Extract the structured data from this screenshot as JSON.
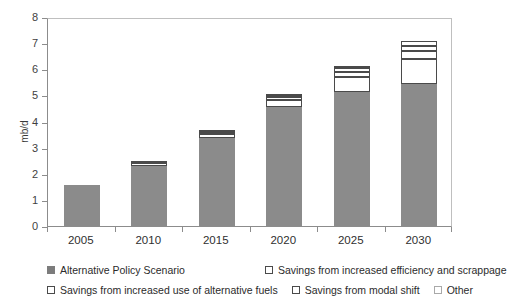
{
  "chart_data": {
    "type": "bar",
    "title": "",
    "xlabel": "",
    "ylabel": "mb/d",
    "ylim": [
      0,
      8
    ],
    "yticks": [
      0,
      1,
      2,
      3,
      4,
      5,
      6,
      7,
      8
    ],
    "ytick_labels": [
      "0",
      "1",
      "2",
      "3",
      "4",
      "5",
      "6",
      "7",
      "8"
    ],
    "grid": false,
    "stacked": true,
    "legend_position": "bottom",
    "categories": [
      "2005",
      "2010",
      "2015",
      "2020",
      "2025",
      "2030"
    ],
    "series": [
      {
        "name": "Alternative Policy Scenario",
        "style": "filled",
        "color": "#8b8b8b",
        "values": [
          1.57,
          2.3,
          3.37,
          4.56,
          5.13,
          5.44
        ]
      },
      {
        "name": "Savings from increased efficiency and scrappage",
        "style": "open",
        "color": "#ffffff",
        "values": [
          0.0,
          0.1,
          0.15,
          0.28,
          0.58,
          0.96
        ]
      },
      {
        "name": "Savings from increased use of alternative fuels",
        "style": "open",
        "color": "#ffffff",
        "values": [
          0.0,
          0.03,
          0.05,
          0.1,
          0.2,
          0.3
        ]
      },
      {
        "name": "Savings from modal shift",
        "style": "open",
        "color": "#ffffff",
        "values": [
          0.0,
          0.02,
          0.03,
          0.05,
          0.12,
          0.2
        ]
      },
      {
        "name": "Other",
        "style": "open",
        "color": "#ffffff",
        "values": [
          0.0,
          0.0,
          0.02,
          0.03,
          0.07,
          0.2
        ]
      }
    ],
    "totals": [
      1.57,
      2.45,
      3.62,
      5.02,
      6.1,
      7.1
    ]
  },
  "axis": {
    "y_label": "mb/d"
  },
  "legend": {
    "row1": [
      {
        "label": "Alternative Policy Scenario",
        "swatch": "filled"
      },
      {
        "label": "Savings from increased efficiency and scrappage",
        "swatch": "open"
      }
    ],
    "row2": [
      {
        "label": "Savings from increased use of alternative fuels",
        "swatch": "open"
      },
      {
        "label": "Savings from modal shift",
        "swatch": "open"
      },
      {
        "label": "Other",
        "swatch": "faint"
      }
    ]
  }
}
